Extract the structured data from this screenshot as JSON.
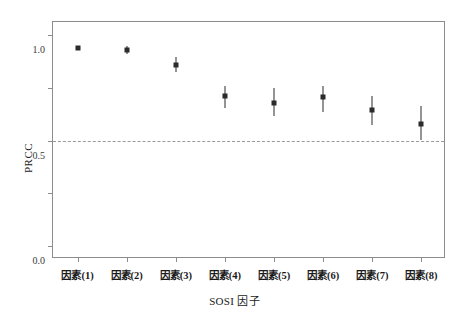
{
  "figure": {
    "top_caption_fragment": "",
    "background": "#ffffff",
    "frame_color": "#8c8c8c",
    "marker_color": "#2b2b2b",
    "zero_line_color": "#9a9a9a"
  },
  "chart_data": {
    "type": "scatter",
    "title": "",
    "xlabel": "SOSI 因子",
    "ylabel": "PRCC",
    "categories": [
      "因素(1)",
      "因素(2)",
      "因素(3)",
      "因素(4)",
      "因素(5)",
      "因素(6)",
      "因素(7)",
      "因素(8)"
    ],
    "values": [
      0.88,
      0.86,
      0.72,
      0.42,
      0.36,
      0.41,
      0.29,
      0.16
    ],
    "error_low": [
      0.86,
      0.82,
      0.65,
      0.31,
      0.23,
      0.27,
      0.15,
      0.0
    ],
    "error_high": [
      0.9,
      0.9,
      0.79,
      0.52,
      0.5,
      0.52,
      0.42,
      0.33
    ],
    "ylim": [
      -1.0,
      1.0
    ],
    "yticks": [
      1.0,
      0.5,
      0.0,
      -0.5,
      -1.0
    ],
    "ytick_labels": [
      "1.0",
      "0.5",
      "0.0",
      "-0.5",
      "-1.0"
    ],
    "grid": false,
    "legend": null,
    "reference_line": 0.0,
    "reference_line_style": "dashed"
  }
}
